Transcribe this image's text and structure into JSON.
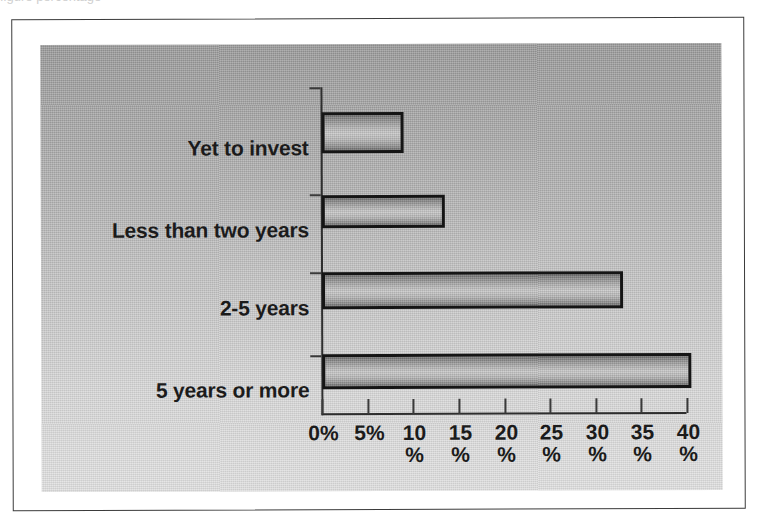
{
  "scan": {
    "top_fragment_text": "figure   percentage"
  },
  "chart_data": {
    "type": "bar",
    "orientation": "horizontal",
    "title": "",
    "subtitle": "",
    "xlabel": "",
    "ylabel": "",
    "categories": [
      "Yet to invest",
      "Less than two years",
      "2-5 years",
      "5 years or more"
    ],
    "values": [
      9,
      13.5,
      33,
      40.5
    ],
    "value_unit": "%",
    "xlim": [
      0,
      40
    ],
    "xticks": [
      0,
      5,
      10,
      15,
      20,
      25,
      30,
      35,
      40
    ],
    "xtick_labels": [
      "0%",
      "5%",
      "10 %",
      "15 %",
      "20 %",
      "25 %",
      "30 %",
      "35 %",
      "40 %"
    ],
    "xtick_label_lines": [
      [
        "0%",
        ""
      ],
      [
        "5%",
        ""
      ],
      [
        "10",
        "%"
      ],
      [
        "15",
        "%"
      ],
      [
        "20",
        "%"
      ],
      [
        "25",
        "%"
      ],
      [
        "30",
        "%"
      ],
      [
        "35",
        "%"
      ],
      [
        "40",
        "%"
      ]
    ],
    "grid": false,
    "legend": false,
    "legend_position": "none",
    "series": [
      {
        "name": "Share of respondents",
        "values": [
          9,
          13.5,
          33,
          40.5
        ]
      }
    ],
    "bars": [
      {
        "label": "Yet to invest",
        "value": 9,
        "value_label": "9%"
      },
      {
        "label": "Less than two years",
        "value": 13.5,
        "value_label": "13.5%"
      },
      {
        "label": "2-5 years",
        "value": 33,
        "value_label": "33%"
      },
      {
        "label": "5 years or more",
        "value": 40.5,
        "value_label": "40.5%"
      }
    ],
    "colors": {
      "bar_outline": "#151515",
      "bar_fill_light": "#c9c9c9",
      "bar_fill_dark": "#6f6f6f",
      "plot_background_top": "#979797",
      "plot_background_bottom": "#dfdfdf",
      "axis": "#2e2e2e",
      "text": "#1b1b1b",
      "frame": "#3b3b3b",
      "page_background": "#ffffff"
    }
  }
}
